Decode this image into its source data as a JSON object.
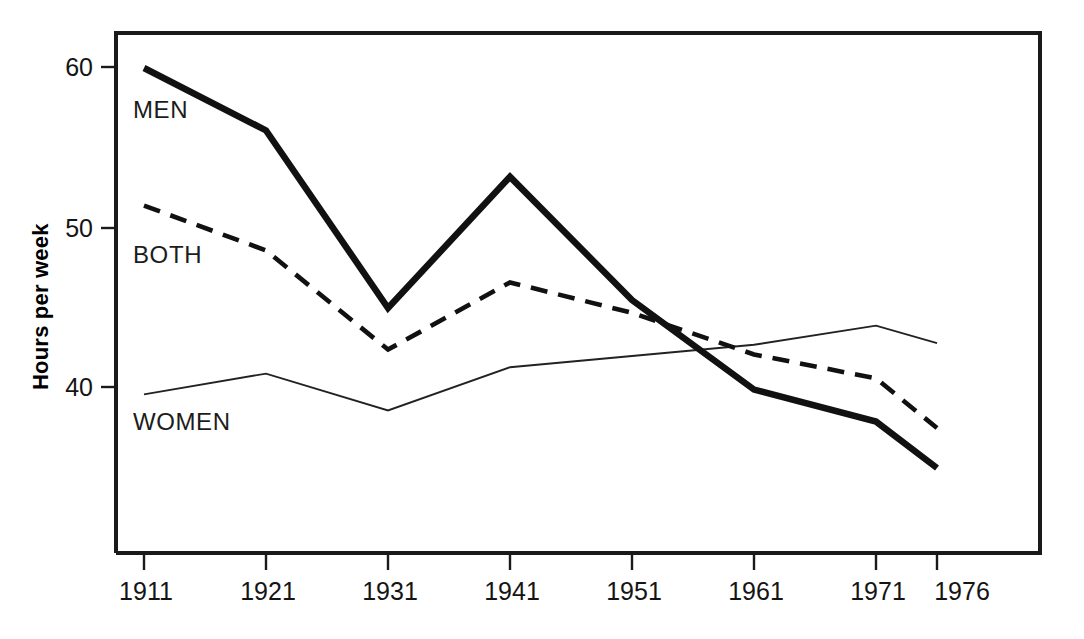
{
  "chart_data": {
    "type": "line",
    "title": "",
    "subtitle": "",
    "xlabel": "",
    "ylabel": "Hours per week",
    "x": [
      1911,
      1921,
      1931,
      1941,
      1951,
      1961,
      1971,
      1976
    ],
    "categories": [
      "1911",
      "1921",
      "1931",
      "1941",
      "1951",
      "1961",
      "1971",
      "1976"
    ],
    "xlim": [
      1911,
      1976
    ],
    "ylim": [
      33,
      61.5
    ],
    "yticks": [
      40,
      50,
      60
    ],
    "ytick_labels": [
      "40",
      "50",
      "60"
    ],
    "grid": false,
    "legend": "inline-labels",
    "series": [
      {
        "name": "MEN",
        "style": "thick-solid",
        "color": "#111111",
        "values": [
          60.0,
          56.1,
          45.0,
          53.2,
          45.5,
          39.9,
          37.9,
          35.0
        ]
      },
      {
        "name": "BOTH",
        "style": "dashed",
        "color": "#111111",
        "values": [
          51.4,
          48.6,
          42.4,
          46.6,
          44.7,
          42.1,
          40.6,
          37.5
        ]
      },
      {
        "name": "WOMEN",
        "style": "thin-solid",
        "color": "#222222",
        "values": [
          39.6,
          40.9,
          38.6,
          41.3,
          42.0,
          42.7,
          43.9,
          42.8
        ]
      }
    ],
    "annotations": [
      {
        "text": "MEN",
        "x": 1913.5,
        "y": 56.0
      },
      {
        "text": "BOTH",
        "x": 1913.5,
        "y": 47.0
      },
      {
        "text": "WOMEN",
        "x": 1913.5,
        "y": 36.8
      }
    ]
  },
  "axes": {
    "y_title": "Hours per week",
    "y_ticks": [
      "60",
      "50",
      "40"
    ],
    "x_ticks": [
      "1911",
      "1921",
      "1931",
      "1941",
      "1951",
      "1961",
      "1971",
      "1976"
    ]
  },
  "series_labels": {
    "men": "MEN",
    "both": "BOTH",
    "women": "WOMEN"
  }
}
